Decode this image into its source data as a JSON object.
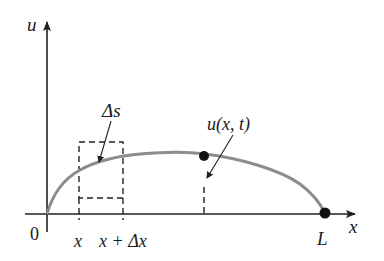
{
  "diagram": {
    "type": "string-displacement-graph",
    "axes": {
      "vertical_label": "u",
      "horizontal_label": "x",
      "origin_label": "0"
    },
    "ticks": {
      "x_label": "x",
      "x_plus_dx_label": "x + Δx",
      "end_label": "L"
    },
    "annotations": {
      "arc_length_label": "Δs",
      "displacement_label": "u(x, t)"
    },
    "colors": {
      "curve": "#8c8c8c",
      "axis": "#222222",
      "dashed": "#222222",
      "point": "#111111"
    }
  }
}
